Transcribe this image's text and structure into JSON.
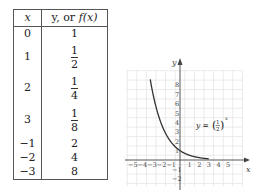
{
  "table": {
    "headers": [
      "x",
      "y, or f(x)"
    ],
    "header_parts": {
      "x": "x",
      "y_label": "y, or ",
      "fx": "f(x)"
    },
    "rows": [
      {
        "x": "0",
        "y": "1",
        "is_fraction": false
      },
      {
        "x": "1",
        "y_num": "1",
        "y_den": "2",
        "is_fraction": true
      },
      {
        "x": "2",
        "y_num": "1",
        "y_den": "4",
        "is_fraction": true
      },
      {
        "x": "3",
        "y_num": "1",
        "y_den": "8",
        "is_fraction": true
      },
      {
        "x": "−1",
        "y": "2",
        "is_fraction": false
      },
      {
        "x": "−2",
        "y": "4",
        "is_fraction": false
      },
      {
        "x": "−3",
        "y": "8",
        "is_fraction": false
      }
    ]
  },
  "graph": {
    "x_axis_label": "x",
    "y_axis_label": "y",
    "x_ticks": [
      "−5",
      "−4",
      "−3",
      "−2",
      "−1",
      "1",
      "2",
      "3",
      "4",
      "5"
    ],
    "y_ticks": [
      "8",
      "7",
      "6",
      "5",
      "4",
      "3",
      "2",
      "1",
      "−1",
      "−2"
    ],
    "equation": {
      "lhs": "y = ",
      "num": "1",
      "den": "2",
      "exp": "x"
    },
    "curve_color": "#333333",
    "grid_color": "#e6e6e6"
  },
  "chart_data": {
    "type": "line",
    "title": "",
    "xlabel": "x",
    "ylabel": "y",
    "x": [
      -3,
      -2,
      -1,
      0,
      1,
      2,
      3
    ],
    "series": [
      {
        "name": "y = (1/2)^x",
        "values": [
          8,
          4,
          2,
          1,
          0.5,
          0.25,
          0.125
        ]
      }
    ],
    "xlim": [
      -5,
      5
    ],
    "ylim": [
      -2,
      8
    ],
    "grid": true,
    "legend": "annotation inside plot near (2, 2.5)"
  }
}
